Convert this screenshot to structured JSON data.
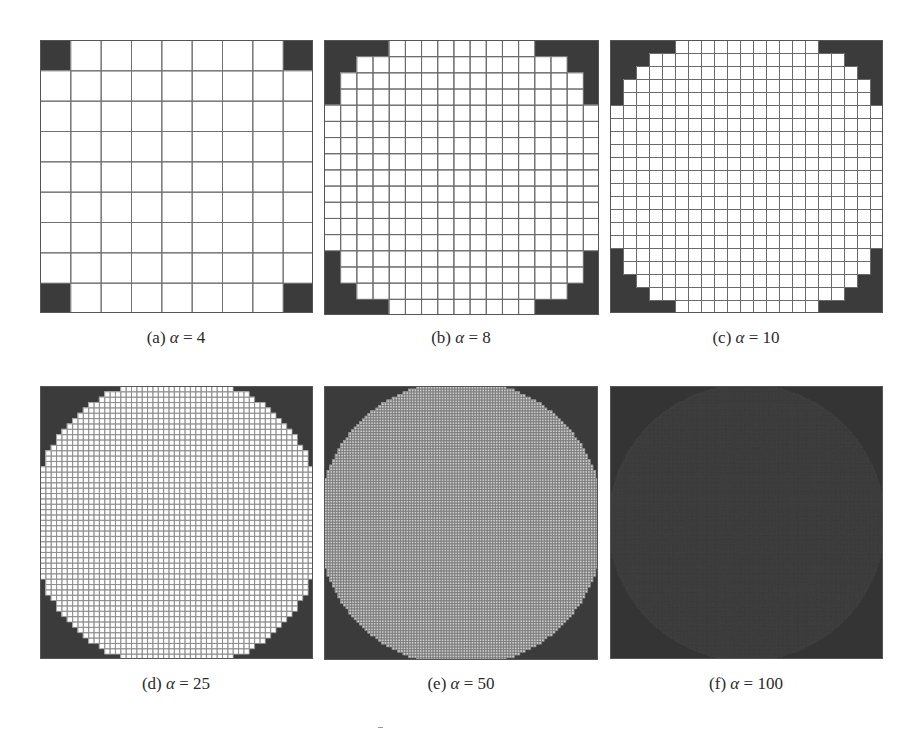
{
  "figure": {
    "panels": [
      {
        "id": "a",
        "label": "(a)",
        "symbol": "α",
        "equals": "=",
        "value": "4",
        "x": 40,
        "y": 40,
        "size": 273,
        "grid": 9,
        "r2": 28.5,
        "fill": "#ffffff",
        "outside": "#3b3b3b",
        "line": "#707070",
        "lineWidth": 1,
        "caption_x": 176,
        "caption_y": 328
      },
      {
        "id": "b",
        "label": "(b)",
        "symbol": "α",
        "equals": "=",
        "value": "8",
        "x": 324,
        "y": 40,
        "size": 275,
        "grid": 17,
        "r2": 85.5,
        "fill": "#ffffff",
        "outside": "#3b3b3b",
        "line": "#6a6a6a",
        "lineWidth": 1,
        "caption_x": 461,
        "caption_y": 328
      },
      {
        "id": "c",
        "label": "(c)",
        "symbol": "α",
        "equals": "=",
        "value": "10",
        "x": 610,
        "y": 40,
        "size": 273,
        "grid": 21,
        "r2": 130,
        "fill": "#ffffff",
        "outside": "#3b3b3b",
        "line": "#6a6a6a",
        "lineWidth": 1,
        "caption_x": 746,
        "caption_y": 328
      },
      {
        "id": "d",
        "label": "(d)",
        "symbol": "α",
        "equals": "=",
        "value": "25",
        "x": 40,
        "y": 386,
        "size": 273,
        "grid": 51,
        "r2": 745,
        "fill": "#ffffff",
        "outside": "#3b3b3b",
        "line": "#8a8a8a",
        "lineWidth": 0.8,
        "caption_x": 176,
        "caption_y": 674
      },
      {
        "id": "e",
        "label": "(e)",
        "symbol": "α",
        "equals": "=",
        "value": "50",
        "x": 324,
        "y": 386,
        "size": 274,
        "grid": 101,
        "r2": 2780,
        "fill": "#cfcfcf",
        "outside": "#3b3b3b",
        "line": "#7a7a7a",
        "lineWidth": 0.7,
        "caption_x": 461,
        "caption_y": 674
      },
      {
        "id": "f",
        "label": "(f)",
        "symbol": "α",
        "equals": "=",
        "value": "100",
        "x": 610,
        "y": 386,
        "size": 273,
        "grid": 201,
        "r2": 10300,
        "fill": "#474747",
        "outside": "#343434",
        "line": "#3f3f3f",
        "lineWidth": 0.4,
        "caption_x": 746,
        "caption_y": 674
      }
    ]
  }
}
